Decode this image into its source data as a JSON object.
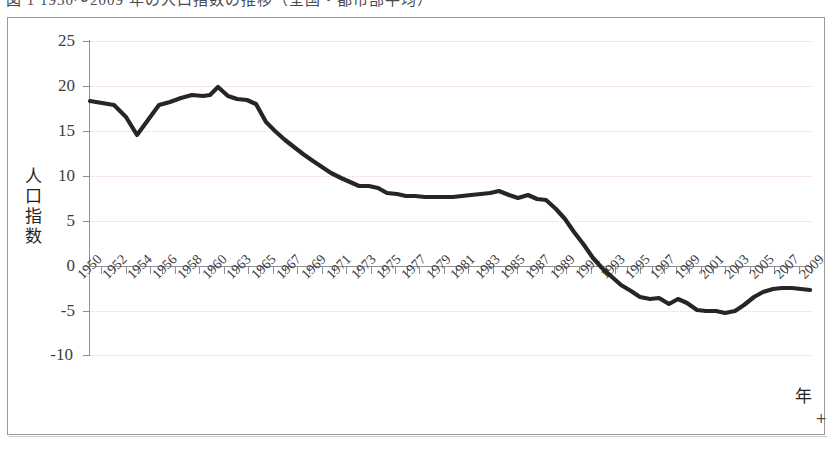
{
  "figure": {
    "caption_partial": "図 1  1950〜2009 年の人口指数の推移（全国・都市部平均）",
    "plus_marker": "+"
  },
  "axes": {
    "y_title": "人口指数",
    "x_title": "年",
    "y_ticks": [
      25,
      20,
      15,
      10,
      5,
      0,
      -5,
      -10
    ],
    "y_tick_labels": [
      "25",
      "20",
      "15",
      "10",
      "5",
      "0",
      "-5",
      "-10"
    ],
    "x_tick_labels": [
      "1950",
      "1952",
      "1954",
      "1956",
      "1958",
      "1960",
      "1963",
      "1965",
      "1967",
      "1969",
      "1971",
      "1973",
      "1975",
      "1977",
      "1979",
      "1981",
      "1983",
      "1985",
      "1987",
      "1989",
      "1991",
      "1993",
      "1995",
      "1997",
      "1999",
      "2001",
      "2003",
      "2005",
      "2007",
      "2009"
    ]
  },
  "style": {
    "line_color": "#262626",
    "grid_color": "#e6d3dd",
    "axis_color": "#8e8e94",
    "frame_color": "#9a9a9e",
    "text_color": "#3c3c42"
  },
  "chart_data": {
    "type": "line",
    "title": "人口指数の推移",
    "xlabel": "年",
    "ylabel": "人口指数",
    "ylim": [
      -10,
      25
    ],
    "xlim": [
      1950,
      2009
    ],
    "grid": true,
    "legend": null,
    "x": [
      1950,
      1951,
      1952,
      1953,
      1954,
      1955,
      1956,
      1957,
      1958,
      1959,
      1960,
      1961,
      1962,
      1963,
      1964,
      1965,
      1966,
      1967,
      1968,
      1969,
      1970,
      1971,
      1972,
      1973,
      1974,
      1975,
      1976,
      1977,
      1978,
      1979,
      1980,
      1981,
      1982,
      1983,
      1984,
      1985,
      1986,
      1987,
      1988,
      1989,
      1990,
      1991,
      1992,
      1993,
      1994,
      1995,
      1996,
      1997,
      1998,
      1999,
      2000,
      2001,
      2002,
      2003,
      2004,
      2005,
      2006,
      2007,
      2008,
      2009
    ],
    "values": [
      17.8,
      17.6,
      17.4,
      16.4,
      15.0,
      16.2,
      17.4,
      17.7,
      18.0,
      18.3,
      18.1,
      18.2,
      19.0,
      18.1,
      17.8,
      17.7,
      17.3,
      15.4,
      14.4,
      13.5,
      12.7,
      11.9,
      11.1,
      10.4,
      9.7,
      9.1,
      8.6,
      8.1,
      8.1,
      7.8,
      7.3,
      7.2,
      7.0,
      7.0,
      6.8,
      6.8,
      6.8,
      6.8,
      6.9,
      7.0,
      7.1,
      7.2,
      7.4,
      7.0,
      6.6,
      7.0,
      6.5,
      6.3,
      5.3,
      4.1,
      2.6,
      1.1,
      -0.3,
      -1.5,
      -2.6,
      -3.6,
      -4.4,
      -5.2,
      -5.5,
      -5.4
    ],
    "series_note": "single series, thick dark line, no markers"
  },
  "series_points_px": [
    [
      90,
      101
    ],
    [
      102,
      103
    ],
    [
      114,
      105
    ],
    [
      126,
      117
    ],
    [
      137,
      135
    ],
    [
      148,
      120
    ],
    [
      159,
      105
    ],
    [
      170,
      102
    ],
    [
      181,
      98
    ],
    [
      192,
      95
    ],
    [
      203,
      96
    ],
    [
      210,
      95
    ],
    [
      218,
      87
    ],
    [
      228,
      96
    ],
    [
      237,
      99
    ],
    [
      247,
      100
    ],
    [
      256,
      104
    ],
    [
      266,
      122
    ],
    [
      275,
      131
    ],
    [
      285,
      140
    ],
    [
      294,
      147
    ],
    [
      303,
      154
    ],
    [
      313,
      161
    ],
    [
      322,
      167
    ],
    [
      331,
      173
    ],
    [
      341,
      178
    ],
    [
      350,
      182
    ],
    [
      359,
      186
    ],
    [
      369,
      186
    ],
    [
      378,
      188
    ],
    [
      387,
      193
    ],
    [
      397,
      194
    ],
    [
      406,
      196
    ],
    [
      415,
      196
    ],
    [
      425,
      197
    ],
    [
      434,
      197
    ],
    [
      443,
      197
    ],
    [
      453,
      197
    ],
    [
      462,
      196
    ],
    [
      471,
      195
    ],
    [
      481,
      194
    ],
    [
      490,
      193
    ],
    [
      499,
      191
    ],
    [
      509,
      195
    ],
    [
      518,
      198
    ],
    [
      528,
      195
    ],
    [
      537,
      199
    ],
    [
      546,
      200
    ],
    [
      556,
      209
    ],
    [
      565,
      219
    ],
    [
      574,
      232
    ],
    [
      584,
      245
    ],
    [
      593,
      258
    ],
    [
      602,
      268
    ],
    [
      612,
      277
    ],
    [
      621,
      285
    ],
    [
      631,
      291
    ],
    [
      640,
      297
    ],
    [
      650,
      299
    ],
    [
      659,
      298
    ],
    [
      669,
      304
    ],
    [
      678,
      299
    ],
    [
      687,
      303
    ],
    [
      697,
      310
    ],
    [
      706,
      311
    ],
    [
      716,
      311
    ],
    [
      725,
      313
    ],
    [
      735,
      311
    ],
    [
      744,
      305
    ],
    [
      754,
      297
    ],
    [
      763,
      292
    ],
    [
      773,
      289
    ],
    [
      782,
      288
    ],
    [
      792,
      288
    ],
    [
      801,
      289
    ],
    [
      810,
      290
    ]
  ]
}
